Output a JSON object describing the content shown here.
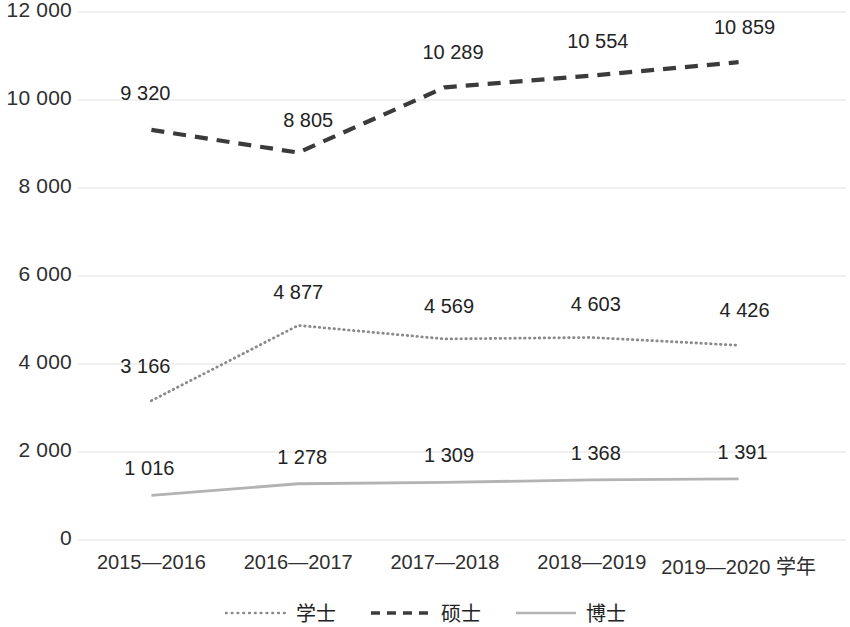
{
  "chart_data": {
    "type": "line",
    "title": "",
    "subtitle": "",
    "xlabel": "学年",
    "ylabel": "",
    "categories": [
      "2015—2016",
      "2016—2017",
      "2017—2018",
      "2018—2019",
      "2019—2020 学年"
    ],
    "series": [
      {
        "name": "学士",
        "style": "dotted",
        "color": "#8a8a8a",
        "values": [
          3166,
          4877,
          4569,
          4603,
          4426
        ],
        "value_labels": [
          "3 166",
          "4 877",
          "4 569",
          "4 603",
          "4 426"
        ]
      },
      {
        "name": "硕士",
        "style": "dashed",
        "color": "#3b3b3b",
        "values": [
          9320,
          8805,
          10289,
          10554,
          10859
        ],
        "value_labels": [
          "9 320",
          "8 805",
          "10 289",
          "10 554",
          "10 859"
        ]
      },
      {
        "name": "博士",
        "style": "solid",
        "color": "#b3b3b3",
        "values": [
          1016,
          1278,
          1309,
          1368,
          1391
        ],
        "value_labels": [
          "1 016",
          "1 278",
          "1 309",
          "1 368",
          "1 391"
        ]
      }
    ],
    "ylim": [
      0,
      12000
    ],
    "ytick_values": [
      12000,
      10000,
      8000,
      6000,
      4000,
      2000,
      0
    ],
    "ytick_labels": [
      "12 000",
      "10 000",
      "8 000",
      "6 000",
      "4 000",
      "2 000",
      "0"
    ],
    "grid": true,
    "grid_color": "#e2e2e2",
    "legend_position": "bottom",
    "legend_entries": [
      "学士",
      "硕士",
      "博士"
    ],
    "background": "#ffffff"
  }
}
